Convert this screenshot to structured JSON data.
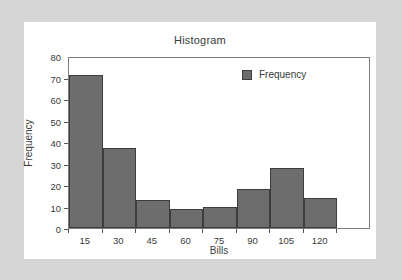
{
  "chart_data": {
    "type": "bar",
    "title": "Histogram",
    "xlabel": "Bills",
    "ylabel": "Frequency",
    "categories": [
      "15",
      "30",
      "45",
      "60",
      "75",
      "90",
      "105",
      "120"
    ],
    "values": [
      71,
      37,
      13,
      9,
      10,
      18,
      28,
      14
    ],
    "series": [
      {
        "name": "Frequency",
        "values": [
          71,
          37,
          13,
          9,
          10,
          18,
          28,
          14
        ]
      }
    ],
    "ylim": [
      0,
      80
    ],
    "yticks": [
      0,
      10,
      20,
      30,
      40,
      50,
      60,
      70,
      80
    ],
    "xticks": [
      "15",
      "30",
      "45",
      "60",
      "75",
      "90",
      "105",
      "120"
    ],
    "grid": false,
    "legend": {
      "position": "top-right",
      "entries": [
        "Frequency"
      ]
    },
    "colors": {
      "bar_fill": "#6d6d6d",
      "bar_edge": "#3d3d3d",
      "axis": "#7d7d7d",
      "text": "#3a3a3a",
      "panel_background": "#ffffff",
      "outer_background": "#d5d5d5"
    }
  }
}
